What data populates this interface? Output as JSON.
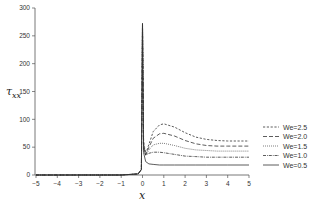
{
  "chart_data": {
    "type": "line",
    "title": "",
    "xlabel": "x",
    "ylabel": "τ_xx",
    "ylabel_main": "τ",
    "ylabel_sub": "xx",
    "xlim": [
      -5,
      5
    ],
    "ylim": [
      0,
      300
    ],
    "xticks": [
      -5,
      -4,
      -3,
      -2,
      -1,
      0,
      1,
      2,
      3,
      4,
      5
    ],
    "yticks": [
      0,
      50,
      100,
      150,
      200,
      250,
      300
    ],
    "grid": false,
    "legend_position": "right",
    "series": [
      {
        "name": "We=2.5",
        "style": "dashed-short",
        "x": [
          -5,
          -1,
          -0.2,
          -0.05,
          0,
          0.05,
          0.15,
          0.3,
          0.5,
          0.8,
          1.0,
          1.5,
          2.0,
          2.5,
          3.0,
          3.5,
          4.0,
          5.0
        ],
        "y": [
          0,
          0,
          2,
          10,
          272,
          60,
          38,
          55,
          78,
          90,
          92,
          86,
          76,
          68,
          64,
          62,
          61,
          61
        ]
      },
      {
        "name": "We=2.0",
        "style": "dashed-long",
        "x": [
          -5,
          -1,
          -0.2,
          -0.05,
          0,
          0.05,
          0.15,
          0.3,
          0.5,
          0.8,
          1.0,
          1.5,
          2.0,
          2.5,
          3.0,
          3.5,
          4.0,
          5.0
        ],
        "y": [
          0,
          0,
          2,
          10,
          272,
          55,
          36,
          50,
          66,
          74,
          75,
          70,
          62,
          56,
          53,
          52,
          52,
          52
        ]
      },
      {
        "name": "We=1.5",
        "style": "dotted",
        "x": [
          -5,
          -1,
          -0.2,
          -0.05,
          0,
          0.05,
          0.15,
          0.3,
          0.5,
          0.8,
          1.0,
          1.5,
          2.0,
          2.5,
          3.0,
          3.5,
          4.0,
          5.0
        ],
        "y": [
          0,
          0,
          2,
          10,
          272,
          50,
          35,
          45,
          54,
          57,
          57,
          53,
          48,
          45,
          44,
          43,
          43,
          43
        ]
      },
      {
        "name": "We=1.0",
        "style": "dash-dot",
        "x": [
          -5,
          -1,
          -0.2,
          -0.05,
          0,
          0.05,
          0.15,
          0.3,
          0.5,
          0.8,
          1.0,
          1.5,
          2.0,
          2.5,
          3.0,
          3.5,
          4.0,
          5.0
        ],
        "y": [
          0,
          0,
          2,
          10,
          272,
          45,
          36,
          39,
          41,
          41,
          40,
          37,
          34,
          33,
          32,
          32,
          32,
          32
        ]
      },
      {
        "name": "We=0.5",
        "style": "solid",
        "x": [
          -5,
          -1,
          -0.2,
          -0.05,
          0,
          0.05,
          0.15,
          0.3,
          0.5,
          0.8,
          1.0,
          1.5,
          2.0,
          2.5,
          3.0,
          3.5,
          4.0,
          5.0
        ],
        "y": [
          0,
          0,
          2,
          10,
          272,
          40,
          24,
          20,
          19,
          18,
          18,
          18,
          18,
          18,
          18,
          18,
          18,
          18
        ]
      }
    ]
  },
  "legend": {
    "items": [
      {
        "label": "We=2.5"
      },
      {
        "label": "We=2.0"
      },
      {
        "label": "We=1.5"
      },
      {
        "label": "We=1.0"
      },
      {
        "label": "We=0.5"
      }
    ]
  }
}
